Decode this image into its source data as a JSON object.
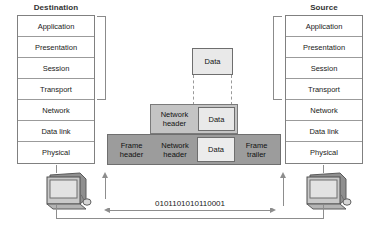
{
  "diagram": {
    "destination": {
      "title": "Destination",
      "layers": [
        "Application",
        "Presentation",
        "Session",
        "Transport",
        "Network",
        "Data link",
        "Physical"
      ]
    },
    "source": {
      "title": "Source",
      "layers": [
        "Application",
        "Presentation",
        "Session",
        "Transport",
        "Network",
        "Data link",
        "Physical"
      ]
    },
    "encapsulation": {
      "tier_data": {
        "cells": [
          "Data"
        ]
      },
      "tier_network": {
        "cells": [
          "Network\nheader",
          "Data"
        ]
      },
      "tier_frame": {
        "cells": [
          "Frame\nheader",
          "Network\nheader",
          "Data",
          "Frame\ntrailer"
        ]
      }
    },
    "link": {
      "bitstream": "0101101010110001"
    },
    "colors": {
      "data_fill": "#e9e9e9",
      "network_fill": "#c4c4c4",
      "frame_fill": "#9c9c9c",
      "border": "#6e6e6e",
      "wire": "#8d8d8d"
    }
  }
}
